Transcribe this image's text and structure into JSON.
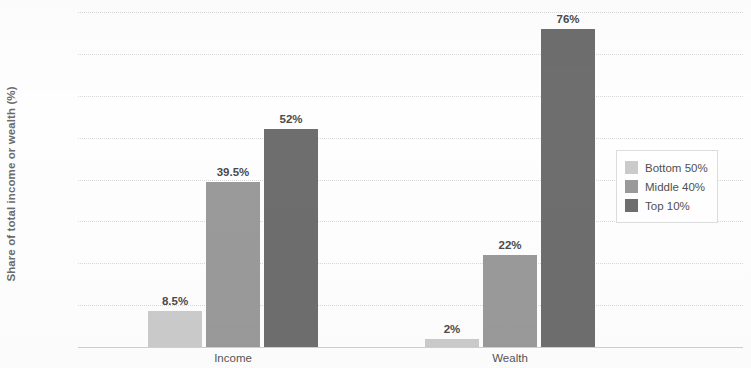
{
  "chart_data": {
    "type": "bar",
    "title": "",
    "xlabel": "",
    "ylabel": "Share of total income or wealth (%)",
    "categories": [
      "Income",
      "Wealth"
    ],
    "series": [
      {
        "name": "Bottom 50%",
        "color": "#cbcbcb",
        "values": [
          8.5,
          2
        ],
        "labels": [
          "8.5%",
          "2%"
        ]
      },
      {
        "name": "Middle 40%",
        "color": "#9a9a9a",
        "values": [
          39.5,
          22
        ],
        "labels": [
          "39.5%",
          "22%"
        ]
      },
      {
        "name": "Top 10%",
        "color": "#6e6e6e",
        "values": [
          52,
          76
        ],
        "labels": [
          "52%",
          "76%"
        ]
      }
    ],
    "ylim": [
      0,
      80
    ],
    "yticks": [
      0,
      10,
      20,
      30,
      40,
      50,
      60,
      70,
      80
    ],
    "ytick_labels": [
      "0%",
      "10%",
      "20%",
      "30%",
      "40%",
      "50%",
      "60%",
      "70%",
      "80%"
    ],
    "grid": true,
    "legend_position": "center right"
  },
  "legend": {
    "items": [
      {
        "label": "Bottom 50%"
      },
      {
        "label": "Middle 40%"
      },
      {
        "label": "Top 10%"
      }
    ]
  }
}
